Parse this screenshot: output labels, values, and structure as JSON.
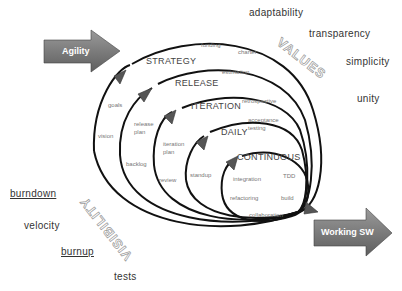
{
  "arrows": {
    "input": {
      "label": "Agility",
      "color": "#7a7a7a"
    },
    "output": {
      "label": "Working SW",
      "color": "#7a7a7a"
    }
  },
  "ring_labels": {
    "values": "VALUES",
    "visibility": "VISIBILITY"
  },
  "levels": [
    {
      "name": "STRATEGY",
      "practices": [
        "goals",
        "vision",
        "funding",
        "charter"
      ]
    },
    {
      "name": "RELEASE",
      "practices": [
        "release plan",
        "backlog",
        "estimation"
      ]
    },
    {
      "name": "ITERATION",
      "practices": [
        "iteration plan",
        "review",
        "retrospective"
      ]
    },
    {
      "name": "DAILY",
      "practices": [
        "standup",
        "acceptance testing"
      ]
    },
    {
      "name": "CONTINUOUS",
      "practices": [
        "integration",
        "TDD",
        "refactoring",
        "build",
        "collaboration"
      ]
    }
  ],
  "values": [
    "adaptability",
    "transparency",
    "simplicity",
    "unity"
  ],
  "visibility": [
    {
      "label": "burndown",
      "underlined": true
    },
    {
      "label": "velocity",
      "underlined": false
    },
    {
      "label": "burnup",
      "underlined": true
    },
    {
      "label": "tests",
      "underlined": false
    }
  ]
}
